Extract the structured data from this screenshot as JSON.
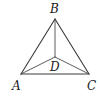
{
  "diagram": {
    "type": "geometry-figure",
    "points": {
      "A": {
        "label": "A",
        "x": 21,
        "y": 74,
        "label_x": 12,
        "label_y": 90
      },
      "B": {
        "label": "B",
        "x": 55,
        "y": 19,
        "label_x": 50,
        "label_y": 13
      },
      "C": {
        "label": "C",
        "x": 89,
        "y": 74,
        "label_x": 87,
        "label_y": 90
      },
      "D": {
        "label": "D",
        "x": 55,
        "y": 57,
        "label_x": 50,
        "label_y": 71
      }
    },
    "segments": [
      {
        "from": "A",
        "to": "B"
      },
      {
        "from": "B",
        "to": "C"
      },
      {
        "from": "A",
        "to": "C"
      },
      {
        "from": "B",
        "to": "D"
      },
      {
        "from": "A",
        "to": "D"
      },
      {
        "from": "C",
        "to": "D"
      }
    ],
    "colors": {
      "stroke": "#3a3a3a",
      "text": "#222222",
      "background": "#ffffff"
    }
  }
}
